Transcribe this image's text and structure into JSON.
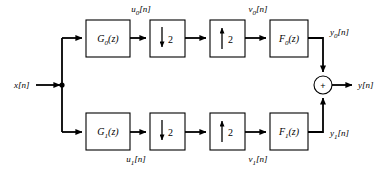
{
  "diagram": {
    "input": {
      "label": "x[n]",
      "base": "x",
      "sub": "",
      "tail": "[n]"
    },
    "output": {
      "label": "y[n]"
    },
    "adder": {
      "symbol": "+",
      "name": "summing-junction"
    },
    "branches": [
      {
        "id": "channel-0",
        "analysis_filter": {
          "base": "G",
          "sub": "0",
          "arg": "(z)",
          "label": "G0(z)"
        },
        "downsampler": {
          "arrow": "down",
          "factor": "2",
          "label": "↓2"
        },
        "upsampler": {
          "arrow": "up",
          "factor": "2",
          "label": "↑2"
        },
        "synthesis_filter": {
          "base": "F",
          "sub": "0",
          "arg": "(z)",
          "label": "F0(z)"
        },
        "signals": {
          "after_analysis": {
            "base": "u",
            "sub": "0",
            "tail": "[n]",
            "label": "u0[n]"
          },
          "after_upsample": {
            "base": "v",
            "sub": "0",
            "tail": "[n]",
            "label": "v0[n]"
          },
          "after_synthesis": {
            "base": "y",
            "sub": "0",
            "tail": "[n]",
            "label": "y0[n]"
          }
        }
      },
      {
        "id": "channel-1",
        "analysis_filter": {
          "base": "G",
          "sub": "1",
          "arg": "(z)",
          "label": "G1(z)"
        },
        "downsampler": {
          "arrow": "down",
          "factor": "2",
          "label": "↓2"
        },
        "upsampler": {
          "arrow": "up",
          "factor": "2",
          "label": "↑2"
        },
        "synthesis_filter": {
          "base": "F",
          "sub": "1",
          "arg": "(z)",
          "label": "F1(z)"
        },
        "signals": {
          "after_analysis": {
            "base": "u",
            "sub": "1",
            "tail": "[n]",
            "label": "u1[n]"
          },
          "after_upsample": {
            "base": "v",
            "sub": "1",
            "tail": "[n]",
            "label": "v1[n]"
          },
          "after_synthesis": {
            "base": "y",
            "sub": "1",
            "tail": "[n]",
            "label": "y1[n]"
          }
        }
      }
    ],
    "colors": {
      "background": "#ffffff",
      "stroke": "#000000",
      "block_fill": "#ffffff"
    }
  }
}
